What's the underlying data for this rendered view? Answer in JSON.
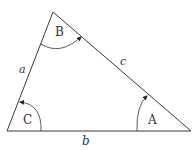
{
  "diagram": {
    "type": "triangle",
    "vertices": [
      {
        "name": "B",
        "x": 53,
        "y": 12
      },
      {
        "name": "C",
        "x": 7,
        "y": 131
      },
      {
        "name": "A",
        "x": 191,
        "y": 131
      }
    ],
    "angle_labels": {
      "top": "B",
      "bottom_left": "C",
      "bottom_right": "A"
    },
    "side_labels": {
      "left": "a",
      "top_right": "c",
      "bottom": "b"
    },
    "colors": {
      "line": "#3a3a3a",
      "text": "#333333",
      "background": "#ffffff"
    }
  }
}
